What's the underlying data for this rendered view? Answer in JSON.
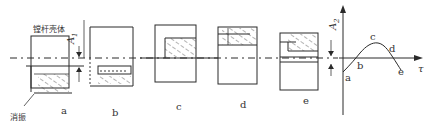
{
  "diagram": {
    "labels": {
      "housing": "镗杆壳体",
      "damper": "消振",
      "a1": "A",
      "a1_sub": "1",
      "a2": "A",
      "a2_sub": "2",
      "tau": "τ"
    },
    "frames": [
      {
        "id": "a",
        "label": "a"
      },
      {
        "id": "b",
        "label": "b"
      },
      {
        "id": "c",
        "label": "c"
      },
      {
        "id": "d",
        "label": "d"
      },
      {
        "id": "e",
        "label": "e"
      }
    ],
    "curve_points": [
      {
        "label": "a"
      },
      {
        "label": "b"
      },
      {
        "label": "c"
      },
      {
        "label": "d"
      },
      {
        "label": "e"
      }
    ],
    "colors": {
      "line": "#2a2a2a",
      "background": "#ffffff"
    }
  }
}
